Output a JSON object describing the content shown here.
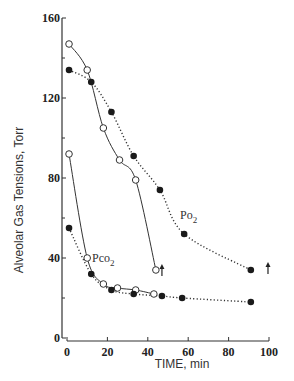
{
  "chart_data": {
    "type": "line",
    "title": "",
    "xlabel": "TIME, min",
    "ylabel": "Alveolar Gas Tensions, Torr",
    "xlim": [
      0,
      100
    ],
    "ylim": [
      0,
      160
    ],
    "x_ticks": [
      0,
      20,
      40,
      60,
      80,
      100
    ],
    "y_ticks": [
      0,
      40,
      80,
      120,
      160
    ],
    "y_minor_ticks": [
      20,
      60,
      100,
      140
    ],
    "grid": false,
    "annotations": [
      {
        "text": "Po2",
        "x": 55,
        "y": 62,
        "refers_to": "PO2 curves"
      },
      {
        "text": "Pco2",
        "x": 12,
        "y": 40,
        "refers_to": "PCO2 curves"
      },
      {
        "type": "up-arrow",
        "x": 47,
        "y": 34,
        "refers_to": "open-circle series end"
      },
      {
        "type": "up-arrow",
        "x": 99.5,
        "y": 35,
        "refers_to": "filled-circle series end"
      }
    ],
    "series": [
      {
        "name": "Po2 (open circles, solid line)",
        "marker": "open-circle",
        "line": "solid",
        "x": [
          1,
          10,
          18,
          26,
          34,
          44
        ],
        "y": [
          147,
          134,
          105,
          89,
          79,
          34
        ]
      },
      {
        "name": "Po2 (filled circles, dotted line)",
        "marker": "filled-circle",
        "line": "dotted",
        "x": [
          1,
          12,
          22,
          33,
          46,
          58,
          91
        ],
        "y": [
          134,
          128,
          113,
          91,
          74,
          52,
          34
        ]
      },
      {
        "name": "Pco2 (open circles, solid line)",
        "marker": "open-circle",
        "line": "solid",
        "x": [
          1,
          10,
          18,
          25,
          34,
          43
        ],
        "y": [
          92,
          40,
          27,
          25,
          24,
          22
        ]
      },
      {
        "name": "Pco2 (filled circles, dotted line)",
        "marker": "filled-circle",
        "line": "dotted",
        "x": [
          1,
          12,
          22,
          33,
          47,
          57,
          91
        ],
        "y": [
          55,
          32,
          24,
          22,
          21,
          20,
          18
        ]
      }
    ]
  },
  "labels": {
    "po2": "Po",
    "po2_sub": "2",
    "pco2": "Pco",
    "pco2_sub": "2"
  }
}
